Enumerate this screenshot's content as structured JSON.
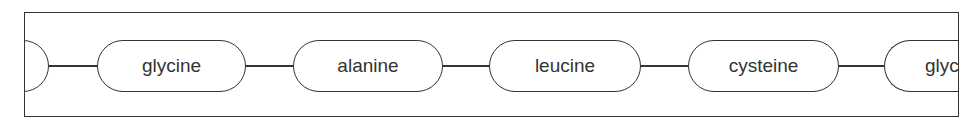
{
  "diagram": {
    "title": "",
    "nodes": [
      {
        "label": "",
        "partial": "left"
      },
      {
        "label": "glycine"
      },
      {
        "label": "alanine"
      },
      {
        "label": "leucine"
      },
      {
        "label": "cysteine"
      },
      {
        "label": "glyc",
        "partial": "right"
      }
    ],
    "stroke_color": "#333333"
  }
}
